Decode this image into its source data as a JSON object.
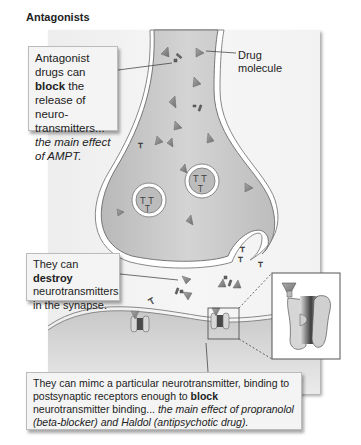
{
  "title": "Antagonists",
  "labels": {
    "drug_molecule_line1": "Drug",
    "drug_molecule_line2": "molecule"
  },
  "callouts": {
    "release": {
      "pre": "Antagonist drugs can ",
      "bold": "block",
      "post": " the release of neuro-transmitters...",
      "italic": "the main effect of AMPT."
    },
    "destroy": {
      "pre": "They can ",
      "bold": "destroy",
      "post": " neurotransmitters in the synapse."
    },
    "receptor": {
      "pre": "They can mimc a particular neurotransmitter, binding to postsynaptic receptors enough to ",
      "bold": "block",
      "post": " neurotransmitter binding...",
      "italic": "the main effect of propranolol (beta-blocker) and Haldol (antipsychotic drug)."
    }
  },
  "colors": {
    "cytoplasm": "#c4c4c4",
    "membrane": "#ffffff",
    "drug": "#8a8a8a",
    "receptor_dark": "#4a4a4a",
    "receptor_light": "#d8d8d8"
  }
}
